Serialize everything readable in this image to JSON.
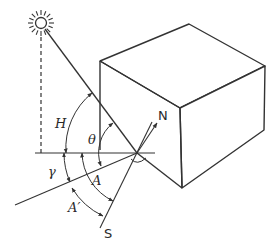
{
  "diagram": {
    "type": "solar-geometry-illustration",
    "colors": {
      "stroke": "#333333",
      "background": "#ffffff"
    },
    "elements": {
      "sun": {
        "icon": "sun-icon"
      },
      "building": {
        "shape": "rectangular-box"
      },
      "direction_labels": {
        "north": "N",
        "south": "S"
      },
      "angle_labels": {
        "altitude": "H",
        "incidence": "θ",
        "wall_azimuth": "γ",
        "solar_azimuth": "A",
        "solar_azimuth_prime": "A′"
      }
    }
  }
}
